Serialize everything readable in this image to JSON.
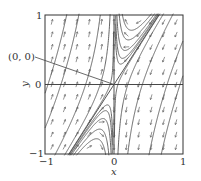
{
  "chart_data": {
    "type": "vector-field",
    "title": "",
    "xlabel": "x",
    "ylabel": "y",
    "xlim": [
      -1,
      1
    ],
    "ylim": [
      -1,
      1
    ],
    "x_ticks": [
      {
        "value": -1,
        "label": "−1"
      },
      {
        "value": 0,
        "label": "0"
      },
      {
        "value": 1,
        "label": "1"
      }
    ],
    "y_ticks": [
      {
        "value": -1,
        "label": "−1"
      },
      {
        "value": 0,
        "label": "0"
      },
      {
        "value": 1,
        "label": "1"
      }
    ],
    "grid": false,
    "annotations": [
      {
        "text": "(0, 0)",
        "points_to": [
          0,
          0
        ]
      }
    ],
    "equilibrium": {
      "x": 0,
      "y": 0,
      "kind": "saddle"
    },
    "field": {
      "dx": "-x",
      "dy": "-3.08*x + y"
    },
    "separatrices": [
      {
        "kind": "line",
        "description": "y = x/0.65 (stable direction)"
      },
      {
        "kind": "line",
        "description": "x = 0 (unstable direction)"
      }
    ],
    "trajectories_family": "y = x/0.65 + c/x",
    "trajectory_c_values": [
      0.099,
      0.067,
      0.039,
      0.023,
      0.014,
      -0.005,
      -0.062,
      -0.26,
      -0.91,
      -1.41
    ],
    "arrow_grid": {
      "nx": 11,
      "ny": 11
    }
  },
  "style": {
    "line_color": "#555555",
    "arrow_color": "#666666",
    "frame_color": "#333333",
    "annotation_line_color": "#444444"
  },
  "layout": {
    "frame": {
      "left": 45,
      "top": 15,
      "right": 183,
      "bottom": 154
    },
    "annotation_text_pos": [
      8,
      59
    ],
    "annotation_line_start": [
      35,
      57
    ]
  },
  "labels": {
    "annotation": "(0, 0)",
    "xlabel": "x",
    "ylabel": "y",
    "x_tick_neg1": "−1",
    "x_tick_0": "0",
    "x_tick_1": "1",
    "y_tick_neg1": "−1",
    "y_tick_0": "0",
    "y_tick_1": "1"
  }
}
